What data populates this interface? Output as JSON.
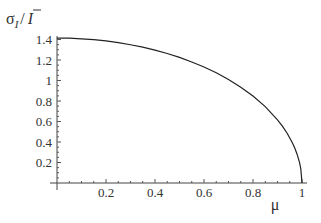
{
  "chart_data": {
    "type": "line",
    "title": "",
    "xlabel": "μ",
    "ylabel": "σ_I / Ī",
    "ylabel_parts": {
      "sigma": "σ",
      "sub": "I",
      "slash": "/",
      "ibar": "I"
    },
    "xlim": [
      0,
      1
    ],
    "ylim": [
      0,
      1.4142
    ],
    "grid": false,
    "legend": null,
    "x_ticks": [
      0.2,
      0.4,
      0.6,
      0.8,
      1
    ],
    "x_tick_labels": [
      "0.2",
      "0.4",
      "0.6",
      "0.8",
      "1"
    ],
    "y_ticks": [
      0.2,
      0.4,
      0.6,
      0.8,
      1,
      1.2,
      1.4
    ],
    "y_tick_labels": [
      "0.2",
      "0.4",
      "0.6",
      "0.8",
      "1",
      "1.2",
      "1.4"
    ],
    "series": [
      {
        "name": "sigma_I_over_Ibar",
        "color": "#222222",
        "x": [
          0,
          0.05,
          0.1,
          0.15,
          0.2,
          0.25,
          0.3,
          0.35,
          0.4,
          0.45,
          0.5,
          0.55,
          0.6,
          0.65,
          0.7,
          0.75,
          0.8,
          0.85,
          0.9,
          0.92,
          0.94,
          0.96,
          0.97,
          0.98,
          0.99,
          0.995,
          1
        ],
        "y": [
          1.414,
          1.413,
          1.407,
          1.398,
          1.386,
          1.369,
          1.349,
          1.325,
          1.296,
          1.263,
          1.225,
          1.181,
          1.131,
          1.075,
          1.01,
          0.935,
          0.849,
          0.745,
          0.616,
          0.554,
          0.483,
          0.396,
          0.344,
          0.281,
          0.199,
          0.141,
          0
        ]
      }
    ]
  }
}
